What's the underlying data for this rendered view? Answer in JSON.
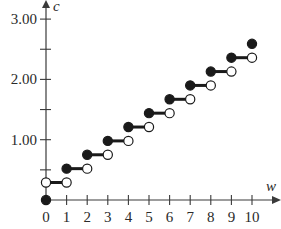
{
  "chart_data": {
    "type": "line",
    "subtype": "step",
    "title": "",
    "xlabel": "w",
    "ylabel": "c",
    "xlim": [
      0,
      10
    ],
    "ylim": [
      0,
      3.0
    ],
    "grid": false,
    "legend": null,
    "x_ticks": [
      0,
      1,
      2,
      3,
      4,
      5,
      6,
      7,
      8,
      9,
      10
    ],
    "x_tick_labels": [
      "0",
      "1",
      "2",
      "3",
      "4",
      "5",
      "6",
      "7",
      "8",
      "9",
      "10"
    ],
    "y_ticks": [
      0.5,
      1.0,
      1.5,
      2.0,
      2.5,
      3.0
    ],
    "y_tick_labels": [
      "",
      "1.00",
      "",
      "2.00",
      "",
      "3.00"
    ],
    "segments": [
      {
        "x_start": 0,
        "x_end": 1,
        "y": 0.29,
        "start_closed": false,
        "end_closed": false
      },
      {
        "x_start": 1,
        "x_end": 2,
        "y": 0.52,
        "start_closed": true,
        "end_closed": false
      },
      {
        "x_start": 2,
        "x_end": 3,
        "y": 0.75,
        "start_closed": true,
        "end_closed": false
      },
      {
        "x_start": 3,
        "x_end": 4,
        "y": 0.98,
        "start_closed": true,
        "end_closed": false
      },
      {
        "x_start": 4,
        "x_end": 5,
        "y": 1.21,
        "start_closed": true,
        "end_closed": false
      },
      {
        "x_start": 5,
        "x_end": 6,
        "y": 1.44,
        "start_closed": true,
        "end_closed": false
      },
      {
        "x_start": 6,
        "x_end": 7,
        "y": 1.67,
        "start_closed": true,
        "end_closed": false
      },
      {
        "x_start": 7,
        "x_end": 8,
        "y": 1.9,
        "start_closed": true,
        "end_closed": false
      },
      {
        "x_start": 8,
        "x_end": 9,
        "y": 2.13,
        "start_closed": true,
        "end_closed": false
      },
      {
        "x_start": 9,
        "x_end": 10,
        "y": 2.36,
        "start_closed": true,
        "end_closed": false
      }
    ],
    "isolated_points": [
      {
        "x": 0,
        "y": 0,
        "filled": true
      },
      {
        "x": 10,
        "y": 2.59,
        "filled": true
      }
    ]
  },
  "labels": {
    "x_axis": "w",
    "y_axis": "c"
  },
  "style": {
    "axis_color": "#3a3a3a",
    "line_color": "#1a1a1a",
    "filled_dot_color": "#1a1a1a",
    "open_dot_fill": "#ffffff"
  }
}
